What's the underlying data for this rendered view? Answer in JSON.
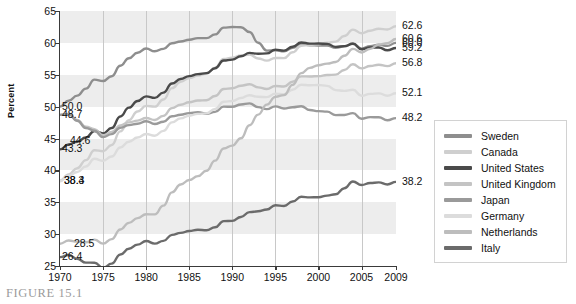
{
  "figure": {
    "caption": "FIGURE 15.1"
  },
  "chart_data": {
    "type": "line",
    "title": "",
    "xlabel": "",
    "ylabel": "Percent",
    "xlim": [
      1970,
      2009
    ],
    "ylim": [
      25,
      65
    ],
    "grid": true,
    "legend_position": "right",
    "xticks": [
      "1970",
      "1975",
      "1980",
      "1985",
      "1990",
      "1995",
      "2000",
      "2005",
      "2009"
    ],
    "yticks": [
      "25",
      "30",
      "35",
      "40",
      "45",
      "50",
      "55",
      "60",
      "65"
    ],
    "x": [
      1970,
      1975,
      1980,
      1985,
      1990,
      1995,
      2000,
      2005,
      2009
    ],
    "series": [
      {
        "name": "Sweden",
        "color": "#8e8e8e",
        "start_label": "50.0",
        "end_label": "60.0",
        "values": [
          50.0,
          54.5,
          59.0,
          60.2,
          62.6,
          58.8,
          59.6,
          59.4,
          60.0
        ]
      },
      {
        "name": "Canada",
        "color": "#cfcfcf",
        "start_label": "38.4",
        "end_label": "62.6",
        "values": [
          38.4,
          43.5,
          50.0,
          54.2,
          57.8,
          57.6,
          59.8,
          61.8,
          62.6
        ]
      },
      {
        "name": "United States",
        "color": "#4a4a4a",
        "start_label": "43.3",
        "end_label": "59.2",
        "values": [
          43.3,
          46.3,
          51.5,
          54.5,
          57.5,
          58.9,
          59.9,
          59.3,
          59.2
        ]
      },
      {
        "name": "United Kingdom",
        "color": "#c4c4c4",
        "start_label": "48.7",
        "end_label": "56.8",
        "values": [
          48.7,
          46.0,
          48.1,
          50.4,
          53.0,
          53.2,
          54.8,
          56.3,
          56.8
        ]
      },
      {
        "name": "Japan",
        "color": "#9a9a9a",
        "start_label": "48.7",
        "end_label": "60.6",
        "values": [
          48.7,
          45.7,
          47.6,
          48.7,
          50.1,
          50.0,
          49.3,
          48.4,
          48.2
        ]
      },
      {
        "name": "Germany",
        "color": "#dcdcdc",
        "start_label": "38.3",
        "end_label": "52.1",
        "values": [
          38.3,
          42.0,
          45.6,
          48.3,
          51.0,
          52.0,
          53.4,
          52.0,
          52.1
        ]
      },
      {
        "name": "Netherlands",
        "color": "#bdbdbd",
        "start_label": "28.5",
        "end_label": "60.6",
        "values": [
          28.5,
          29.0,
          33.0,
          38.2,
          44.0,
          51.5,
          56.5,
          58.8,
          60.6
        ]
      },
      {
        "name": "Italy",
        "color": "#6b6b6b",
        "start_label": "26.4",
        "end_label": "38.2",
        "values": [
          26.4,
          25.2,
          28.8,
          30.2,
          32.2,
          34.5,
          35.8,
          38.0,
          38.2
        ]
      }
    ],
    "left_value_labels": [
      "50.0",
      "48.7",
      "44.6",
      "43.3",
      "38.4",
      "38.3",
      "28.5",
      "26.4"
    ],
    "right_value_labels": [
      "62.6",
      "60.6",
      "60.0",
      "59.2",
      "56.8",
      "52.1",
      "48.2",
      "38.2"
    ]
  },
  "legend": {
    "items": [
      {
        "label": "Sweden"
      },
      {
        "label": "Canada"
      },
      {
        "label": "United States"
      },
      {
        "label": "United Kingdom"
      },
      {
        "label": "Japan"
      },
      {
        "label": "Germany"
      },
      {
        "label": "Netherlands"
      },
      {
        "label": "Italy"
      }
    ]
  }
}
